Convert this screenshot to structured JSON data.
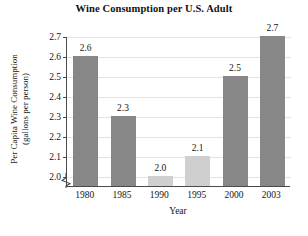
{
  "chart_data": {
    "type": "bar",
    "title": "Wine Consumption per U.S. Adult",
    "xlabel": "Year",
    "ylabel": "Per Capita Wine Consumption (gallons per person)",
    "ylabel_line1": "Per Capita Wine Consumption",
    "ylabel_line2": "(gallons per person)",
    "categories": [
      "1980",
      "1985",
      "1990",
      "1995",
      "2000",
      "2003"
    ],
    "values": [
      2.6,
      2.3,
      2.0,
      2.1,
      2.5,
      2.7
    ],
    "value_labels": [
      "2.6",
      "2.3",
      "2.0",
      "2.1",
      "2.5",
      "2.7"
    ],
    "bar_colors": [
      "#878787",
      "#878787",
      "#cfcfcf",
      "#cfcfcf",
      "#878787",
      "#878787"
    ],
    "bar_shades": [
      "dark",
      "dark",
      "light",
      "light",
      "dark",
      "dark"
    ],
    "ylim": [
      1.95,
      2.7
    ],
    "yticks": [
      2.0,
      2.1,
      2.2,
      2.3,
      2.4,
      2.5,
      2.6,
      2.7
    ],
    "ytick_labels": [
      "2.0",
      "2.1",
      "2.2",
      "2.3",
      "2.4",
      "2.5",
      "2.6",
      "2.7"
    ],
    "grid": true,
    "legend": "none",
    "axis_break": true,
    "grid_color": "#e2e2e2",
    "axis_color": "#4a4a4a"
  }
}
